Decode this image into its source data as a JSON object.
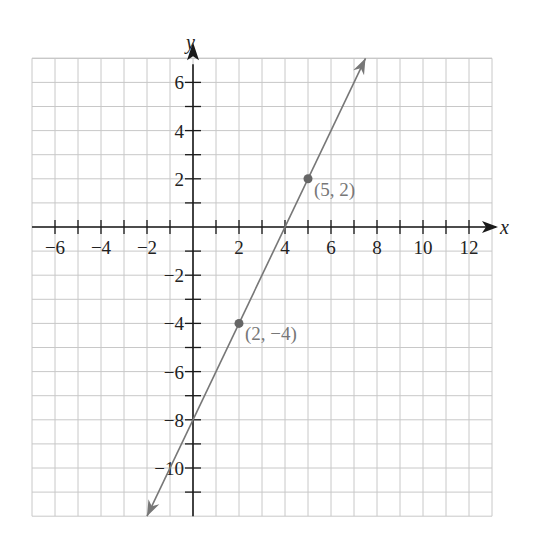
{
  "chart_data": {
    "type": "line",
    "title": "",
    "xlabel": "x",
    "ylabel": "y",
    "xlim": [
      -7,
      13
    ],
    "ylim": [
      -12,
      7
    ],
    "grid": true,
    "x_ticks": [
      -6,
      -5,
      -4,
      -3,
      -2,
      -1,
      1,
      2,
      3,
      4,
      5,
      6,
      7,
      8,
      9,
      10,
      11,
      12
    ],
    "x_tick_labels": [
      {
        "value": -6,
        "label": "−6"
      },
      {
        "value": -4,
        "label": "−4"
      },
      {
        "value": -2,
        "label": "−2"
      },
      {
        "value": 2,
        "label": "2"
      },
      {
        "value": 4,
        "label": "4"
      },
      {
        "value": 6,
        "label": "6"
      },
      {
        "value": 8,
        "label": "8"
      },
      {
        "value": 10,
        "label": "10"
      },
      {
        "value": 12,
        "label": "12"
      }
    ],
    "y_ticks": [
      6,
      5,
      4,
      3,
      2,
      1,
      -1,
      -2,
      -3,
      -4,
      -5,
      -6,
      -7,
      -8,
      -9,
      -10,
      -11
    ],
    "y_tick_labels": [
      {
        "value": 6,
        "label": "6"
      },
      {
        "value": 4,
        "label": "4"
      },
      {
        "value": 2,
        "label": "2"
      },
      {
        "value": -2,
        "label": "−2"
      },
      {
        "value": -4,
        "label": "−4"
      },
      {
        "value": -6,
        "label": "−6"
      },
      {
        "value": -8,
        "label": "−8"
      },
      {
        "value": -10,
        "label": "−10"
      }
    ],
    "series": [
      {
        "name": "line through (2, −4) and (5, 2)",
        "equation": "y = 2x − 8",
        "slope": 2,
        "y_intercept": -8,
        "x_intercept": 4,
        "x": [
          -2,
          7.5
        ],
        "y": [
          -12,
          7
        ],
        "arrows": "both",
        "color": "#777777"
      }
    ],
    "points": [
      {
        "x": 5,
        "y": 2,
        "label": "(5, 2)"
      },
      {
        "x": 2,
        "y": -4,
        "label": "(2, −4)"
      }
    ],
    "colors": {
      "axis": "#1a1a1a",
      "grid": "#c8c8c8",
      "line": "#777777",
      "point": "#666666",
      "point_label": "#777777"
    }
  }
}
